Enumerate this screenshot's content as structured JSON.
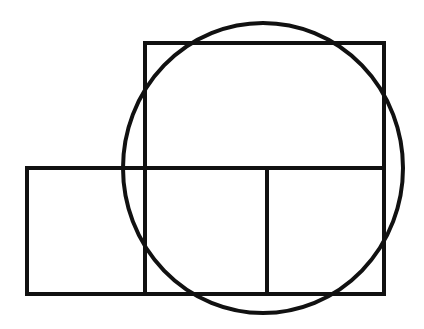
{
  "diagram": {
    "background": "#ffffff",
    "stroke": "#111111",
    "stroke_width": 4,
    "shapes": {
      "upper_rect": {
        "x": 145,
        "y": 43,
        "w": 239,
        "h": 125
      },
      "lower_rect": {
        "x": 27,
        "y": 168,
        "w": 357,
        "h": 126
      },
      "dividers": [
        145,
        267
      ],
      "circle": {
        "cx": 263,
        "cy": 168,
        "rx": 140,
        "ry": 145
      }
    }
  }
}
